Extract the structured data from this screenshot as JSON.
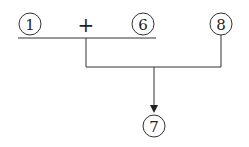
{
  "diagram": {
    "nodes": [
      {
        "id": "n1",
        "label": "1"
      },
      {
        "id": "op",
        "label": "+"
      },
      {
        "id": "n6",
        "label": "6"
      },
      {
        "id": "n8",
        "label": "8"
      },
      {
        "id": "n7",
        "label": "7"
      }
    ],
    "edges": [
      {
        "from": "n1 + n6",
        "to": "n7"
      },
      {
        "from": "n8",
        "to": "n7"
      }
    ],
    "colors": {
      "stroke": "#333333",
      "text": "#222222"
    }
  }
}
